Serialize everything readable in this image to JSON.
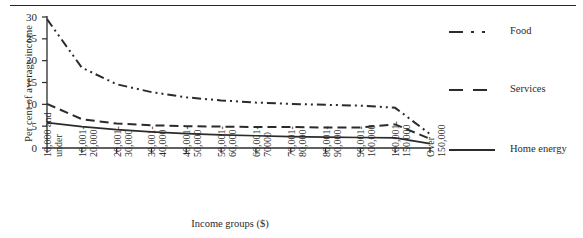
{
  "figure": {
    "top_rule": "horizontal-rule"
  },
  "chart_data": {
    "type": "line",
    "title": "",
    "xlabel": "Income groups ($)",
    "ylabel": "Per cent of average income",
    "ylim": [
      0,
      30
    ],
    "yticks": [
      0,
      5,
      10,
      15,
      20,
      25,
      30
    ],
    "grid": false,
    "legend_position": "right",
    "categories": [
      "10,000 and under",
      "10,001-20,000",
      "20,001-30,000",
      "30,001-40,000",
      "40,001-50,000",
      "50,001-60,000",
      "60,001-70000",
      "70,001-80,000",
      "80,001-90,000",
      "90,001-100,000",
      "100,001-150,000",
      "Over 150,000"
    ],
    "series": [
      {
        "name": "Food",
        "style": "dash-dot-dot",
        "color": "#2b2b2b",
        "values": [
          29.5,
          18.4,
          14.6,
          12.8,
          11.6,
          10.9,
          10.4,
          10.1,
          9.9,
          9.7,
          9.2,
          3.2
        ]
      },
      {
        "name": "Services",
        "style": "dashed",
        "color": "#2b2b2b",
        "values": [
          10.1,
          6.6,
          5.6,
          5.2,
          5.0,
          4.9,
          4.8,
          4.8,
          4.7,
          4.7,
          5.4,
          2.1
        ]
      },
      {
        "name": "Home energy",
        "style": "solid",
        "color": "#2b2b2b",
        "values": [
          5.8,
          4.9,
          4.2,
          3.7,
          3.3,
          3.0,
          2.8,
          2.6,
          2.5,
          2.4,
          2.3,
          1.0
        ]
      }
    ]
  },
  "legend": {
    "items": [
      {
        "label": "Food",
        "swatch": "dash-dot-dot-line-swatch"
      },
      {
        "label": "Services",
        "swatch": "dashed-line-swatch"
      },
      {
        "label": "Home energy",
        "swatch": "solid-line-swatch"
      }
    ]
  }
}
